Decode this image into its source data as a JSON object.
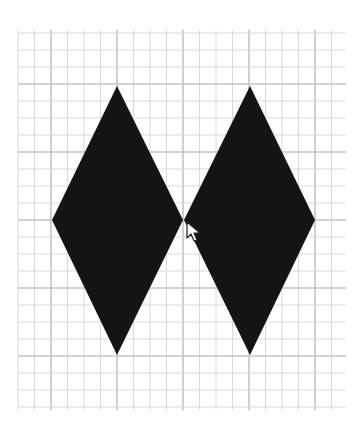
{
  "canvas": {
    "width": 364,
    "height": 424,
    "background": "#ffffff",
    "grid": {
      "x0": 18,
      "x1": 346,
      "y0": 30,
      "y1": 410,
      "cell_w": 16.5,
      "cell_h": 17.0,
      "origin_x": 51,
      "origin_y": 84,
      "major_every": 4,
      "minor_color": "#d9d9d9",
      "major_color": "#c4c4c4"
    },
    "shapes": [
      {
        "name": "left-diamond",
        "fill": "#141414",
        "points": [
          [
            117,
            86
          ],
          [
            183,
            220
          ],
          [
            117,
            355
          ],
          [
            52,
            220
          ]
        ]
      },
      {
        "name": "right-diamond",
        "fill": "#141414",
        "points": [
          [
            250,
            86
          ],
          [
            315,
            220
          ],
          [
            250,
            355
          ],
          [
            184,
            220
          ]
        ]
      }
    ]
  },
  "cursor": {
    "type": "arrow-pointer",
    "x": 186,
    "y": 221
  }
}
